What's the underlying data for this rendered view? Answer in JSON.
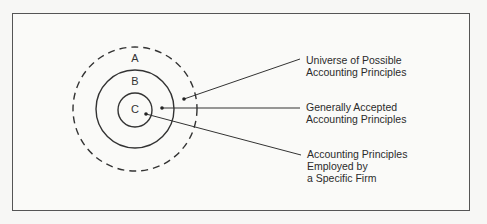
{
  "diagram": {
    "type": "nested-circles",
    "colors": {
      "stroke": "#333333",
      "background": "#fafaf8",
      "frame": "#555555"
    },
    "regions": [
      {
        "id": "A",
        "label": "A",
        "style": "dashed"
      },
      {
        "id": "B",
        "label": "B",
        "style": "solid"
      },
      {
        "id": "C",
        "label": "C",
        "style": "solid"
      }
    ],
    "callouts": [
      {
        "target": "A",
        "lines": [
          "Universe of Possible",
          "Accounting Principles"
        ]
      },
      {
        "target": "B",
        "lines": [
          "Generally Accepted",
          "Accounting Principles"
        ]
      },
      {
        "target": "C",
        "lines": [
          "Accounting Principles",
          "Employed by",
          "a Specific Firm"
        ]
      }
    ]
  }
}
